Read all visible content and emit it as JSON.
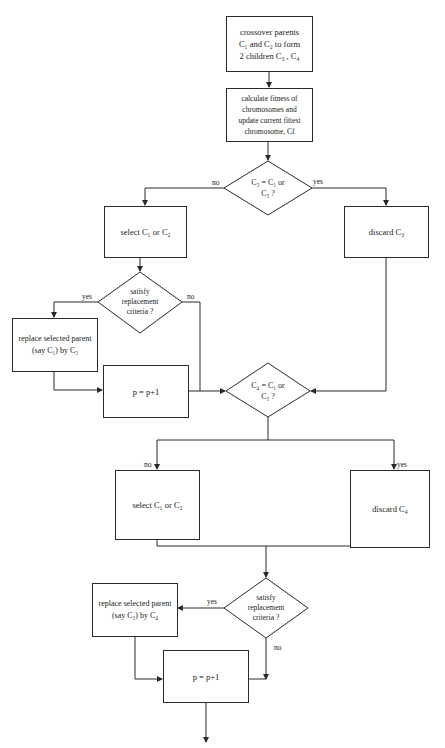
{
  "nodes": {
    "crossover": {
      "text": "crossover parents\nC₁ and C₂ to form\n2 children C₃ , C₄"
    },
    "fitness": {
      "text": "calculate fitness of\nchromosomes and\nupdate current fittest\nchromosome, Cf"
    },
    "decision1": {
      "text": "C₃ = C₁ or\nC₂ ?"
    },
    "select1": {
      "text": "select C₁ or C₂"
    },
    "discard1": {
      "text": "discard  C₃"
    },
    "criteria1": {
      "text": "satisfy\nreplacement\ncriteria ?"
    },
    "replace1": {
      "text": "replace selected parent\n(say C₁) by C₃"
    },
    "increment1": {
      "text": "p = p+1"
    },
    "decision2": {
      "text": "C₄ = C₁ or\nC₂ ?"
    },
    "select2": {
      "text": "select C₁ or C₂"
    },
    "discard2": {
      "text": "discard C₄"
    },
    "criteria2": {
      "text": "satisfy\nreplacement\ncriteria ?"
    },
    "replace2": {
      "text": "replace selected parent\n(say C₂) by C₄"
    },
    "increment2": {
      "text": "p = p+1"
    }
  },
  "labels": {
    "d1_no": "no",
    "d1_yes": "yes",
    "c1_yes": "yes",
    "c1_no": "no",
    "d2_no": "no",
    "d2_yes": "yes",
    "c2_yes": "yes",
    "c2_no": "no"
  },
  "colors": {
    "line": "#2a2a2a",
    "background": "#ffffff"
  }
}
